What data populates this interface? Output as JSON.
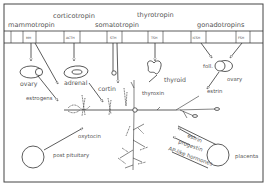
{
  "diagram": {
    "topic": "pituitary hormones and target organs",
    "header_labels": {
      "mammotropin": "mammotropin",
      "corticotropin": "corticotropin",
      "somatotropin": "somatotropin",
      "thyrotropin": "thyrotropin",
      "gonadotropins": "gonadotropins"
    },
    "hormone_boxes": [
      {
        "abbr": "MH"
      },
      {
        "abbr": "ACTH"
      },
      {
        "abbr": "STH"
      },
      {
        "abbr": "TSH"
      },
      {
        "abbr": "ICSH"
      },
      {
        "abbr": "FSH"
      }
    ],
    "organs": {
      "ovary_left": "ovary",
      "adrenal": "adrenal",
      "thyroid": "thyroid",
      "foll": "foll.",
      "ovary_right": "ovary",
      "post_pituitary": "post pituitary",
      "placenta": "placenta"
    },
    "secretions": {
      "estrogens": "estrogens",
      "cortin": "cortin",
      "thyroxin": "thyroxin",
      "estrin_ovary": "estrin",
      "oxytocin": "oxytocin",
      "estrin_placenta": "estrin",
      "progestin": "progestin",
      "ap_like": "AP-like hormones"
    }
  }
}
